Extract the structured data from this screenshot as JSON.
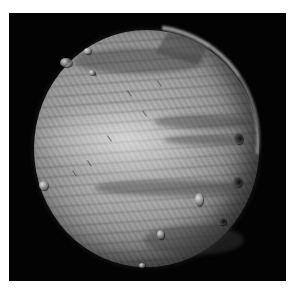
{
  "image": {
    "description": "Grayscale photograph of a spherical celestial body (moon/planet-like disk) with banded surface texture and small crater-like spots against a black background, framed by a thin white border",
    "background_color": "#030303",
    "border_color": "#ffffff",
    "disk_tone_light": "#b8b8b8",
    "disk_tone_dark": "#2a2a2a"
  }
}
